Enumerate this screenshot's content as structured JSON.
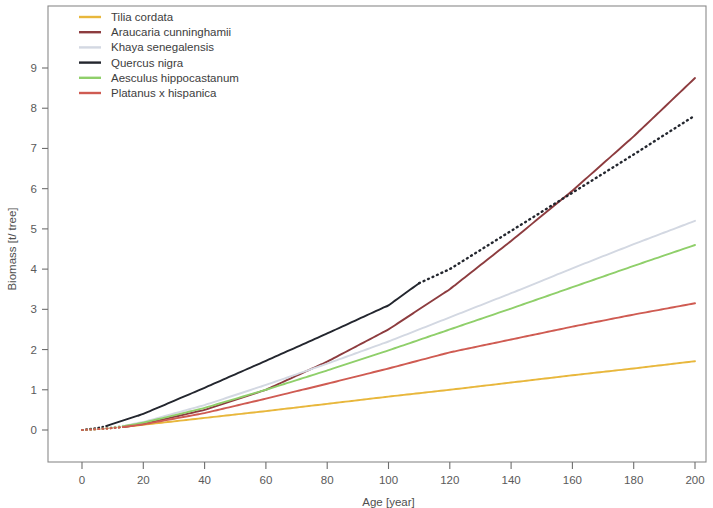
{
  "chart_data": {
    "type": "line",
    "title": "",
    "xlabel": "Age [year]",
    "ylabel": "Biomass [t/ tree]",
    "xlim": [
      0,
      205
    ],
    "ylim": [
      0,
      9.4
    ],
    "xticks": [
      0,
      20,
      40,
      60,
      80,
      100,
      120,
      140,
      160,
      180,
      200
    ],
    "yticks": [
      0,
      1,
      2,
      3,
      4,
      5,
      6,
      7,
      8,
      9
    ],
    "xtick_labels": [
      "0",
      "20",
      "40",
      "60",
      "80",
      "100",
      "120",
      "140",
      "160",
      "180",
      "200"
    ],
    "ytick_labels": [
      "0",
      "1",
      "2",
      "3",
      "4",
      "5",
      "6",
      "7",
      "8",
      "9"
    ],
    "grid": false,
    "legend_position": "top-left",
    "series": [
      {
        "name": "Tilia cordata",
        "color": "#e8b73c",
        "solid_from": 14,
        "x": [
          0,
          5,
          10,
          14,
          20,
          40,
          60,
          80,
          100,
          120,
          140,
          160,
          180,
          200
        ],
        "values": [
          0.0,
          0.02,
          0.05,
          0.08,
          0.13,
          0.3,
          0.47,
          0.65,
          0.83,
          1.0,
          1.18,
          1.36,
          1.53,
          1.71
        ]
      },
      {
        "name": "Araucaria cunninghamii",
        "color": "#8d3c3f",
        "solid_from": 14,
        "x": [
          0,
          5,
          10,
          14,
          20,
          40,
          60,
          80,
          100,
          120,
          140,
          160,
          180,
          200
        ],
        "values": [
          0.0,
          0.02,
          0.05,
          0.08,
          0.15,
          0.5,
          1.0,
          1.7,
          2.5,
          3.5,
          4.7,
          5.95,
          7.3,
          8.75
        ]
      },
      {
        "name": "Khaya senegalensis",
        "color": "#d3d8e2",
        "solid_from": 14,
        "x": [
          0,
          5,
          10,
          14,
          20,
          40,
          60,
          80,
          100,
          120,
          140,
          160,
          180,
          200
        ],
        "values": [
          0.0,
          0.03,
          0.07,
          0.11,
          0.2,
          0.62,
          1.12,
          1.65,
          2.2,
          2.8,
          3.4,
          4.02,
          4.62,
          5.2
        ]
      },
      {
        "name": "Quercus nigra",
        "color": "#23262e",
        "solid_from": 8,
        "solid_to": 110,
        "x": [
          0,
          5,
          8,
          20,
          40,
          60,
          80,
          100,
          110,
          120,
          140,
          160,
          180,
          200
        ],
        "values": [
          0.0,
          0.05,
          0.1,
          0.4,
          1.05,
          1.72,
          2.4,
          3.1,
          3.65,
          4.0,
          4.95,
          5.9,
          6.85,
          7.82
        ]
      },
      {
        "name": "Aesculus hippocastanum",
        "color": "#8fcf6a",
        "solid_from": 14,
        "x": [
          0,
          5,
          10,
          14,
          20,
          40,
          60,
          80,
          100,
          120,
          140,
          160,
          180,
          200
        ],
        "values": [
          0.0,
          0.02,
          0.06,
          0.1,
          0.18,
          0.55,
          1.0,
          1.48,
          1.98,
          2.5,
          3.02,
          3.55,
          4.08,
          4.6
        ]
      },
      {
        "name": "Platanus x hispanica",
        "color": "#cf5b52",
        "solid_from": 14,
        "x": [
          0,
          5,
          10,
          14,
          20,
          40,
          60,
          80,
          100,
          120,
          140,
          160,
          180,
          200
        ],
        "values": [
          0.0,
          0.02,
          0.05,
          0.08,
          0.14,
          0.42,
          0.78,
          1.15,
          1.53,
          1.93,
          2.25,
          2.57,
          2.87,
          3.15
        ]
      }
    ]
  },
  "legend": {
    "items": [
      {
        "label": "Tilia cordata"
      },
      {
        "label": "Araucaria cunninghamii"
      },
      {
        "label": "Khaya senegalensis"
      },
      {
        "label": "Quercus nigra"
      },
      {
        "label": "Aesculus hippocastanum"
      },
      {
        "label": "Platanus x hispanica"
      }
    ]
  }
}
